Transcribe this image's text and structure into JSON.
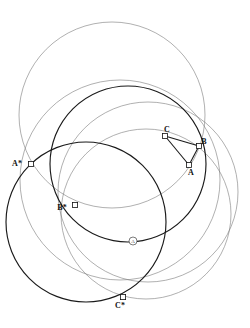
{
  "figure": {
    "title": "",
    "background_color": "#ffffff",
    "width": 250,
    "height": 328
  },
  "colors": {
    "thin_stroke": "#7a7a7a",
    "thick_stroke": "#1a1a1a",
    "point_fill": "#ffffff",
    "point_stroke": "#111111",
    "label_color": "#111111",
    "center_marker_color": "#444444"
  },
  "circles": [
    {
      "name": "circle-top-large",
      "cx": 112,
      "cy": 115,
      "r": 93,
      "weight": "thin"
    },
    {
      "name": "circle-left-mid",
      "cx": 120,
      "cy": 180,
      "r": 100,
      "weight": "thin"
    },
    {
      "name": "circle-right-lower",
      "cx": 148,
      "cy": 192,
      "r": 90,
      "weight": "thin"
    },
    {
      "name": "circle-inner-dark",
      "cx": 128,
      "cy": 164,
      "r": 78,
      "weight": "thick"
    },
    {
      "name": "circle-lower-left-dark",
      "cx": 86,
      "cy": 222,
      "r": 80,
      "weight": "thick"
    },
    {
      "name": "circle-lower-right-thin",
      "cx": 146,
      "cy": 214,
      "r": 85,
      "weight": "thin"
    }
  ],
  "triangle": {
    "name": "triangle-ABC",
    "weight": "thick",
    "vertices": [
      "A",
      "B",
      "C"
    ]
  },
  "points": [
    {
      "id": "A",
      "label": "A",
      "x": 189,
      "y": 165,
      "label_dx": 2,
      "label_dy": 10,
      "weight": "thick"
    },
    {
      "id": "B",
      "label": "B",
      "x": 199,
      "y": 146,
      "label_dx": 5,
      "label_dy": -2,
      "weight": "thick"
    },
    {
      "id": "C",
      "label": "C",
      "x": 165,
      "y": 136,
      "label_dx": 2,
      "label_dy": -4,
      "weight": "thick"
    },
    {
      "id": "As",
      "label": "A*",
      "x": 31,
      "y": 164,
      "label_dx": -14,
      "label_dy": 2,
      "weight": "thick"
    },
    {
      "id": "Bs",
      "label": "B*",
      "x": 75,
      "y": 205,
      "label_dx": -13,
      "label_dy": 5,
      "weight": "thick"
    },
    {
      "id": "Cs",
      "label": "C*",
      "x": 123,
      "y": 297,
      "label_dx": -3,
      "label_dy": 11,
      "weight": "thick"
    }
  ],
  "center_marker": {
    "name": "circled-A-marker",
    "label": "A",
    "x": 133,
    "y": 241,
    "r": 4
  }
}
